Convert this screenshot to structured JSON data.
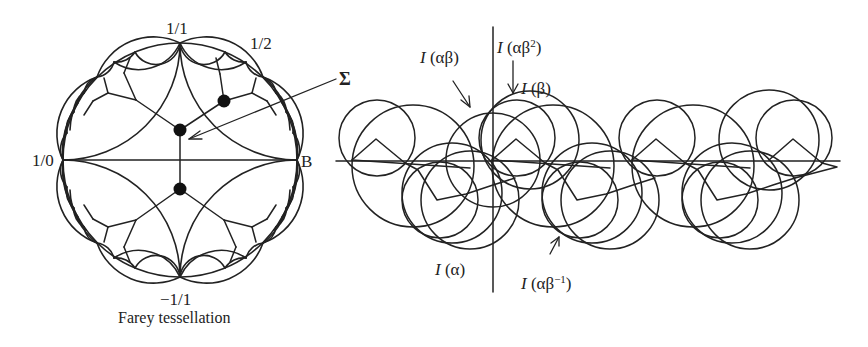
{
  "figure": {
    "left_panel": {
      "caption": "Farey tessellation",
      "labels": {
        "top": "1/1",
        "upper_right": "1/2",
        "left": "1/0",
        "right": "B",
        "bottom": "−1/1"
      },
      "disk": {
        "cx": 180,
        "cy": 160,
        "r": 117
      }
    },
    "sigma_label": "Σ",
    "right_panel": {
      "labels": {
        "I_ab": {
          "italic": "I",
          "arg": " (αβ)"
        },
        "I_ab2": {
          "italic": "I",
          "arg_pre": " (αβ",
          "sup": "2",
          "arg_post": ")"
        },
        "I_b": {
          "italic": "I",
          "arg": " (β)"
        },
        "I_a": {
          "italic": "I",
          "arg": " (α)"
        },
        "I_abinv": {
          "italic": "I",
          "arg_pre": " (αβ",
          "sup": "−1",
          "arg_post": ")"
        }
      },
      "axis": {
        "y": 161,
        "x_start": 336,
        "x_end": 840
      },
      "vertical_line": {
        "x": 493,
        "y_start": 27,
        "y_end": 292
      },
      "period_px": 140
    },
    "colors": {
      "ink": "#222222",
      "background": "#ffffff"
    }
  }
}
